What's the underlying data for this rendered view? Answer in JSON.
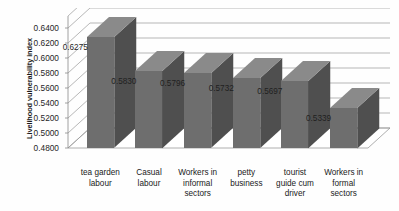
{
  "chart_data": {
    "type": "bar",
    "title": "",
    "xlabel": "",
    "ylabel": "Livelihood vulnerability index",
    "categories": [
      "tea garden labour",
      "Casual labour",
      "Workers in informal sectors",
      "petty business",
      "tourist guide cum driver",
      "Workers in formal sectors"
    ],
    "category_lines": [
      [
        "tea garden",
        "labour"
      ],
      [
        "Casual",
        "labour"
      ],
      [
        "Workers in",
        "informal",
        "sectors"
      ],
      [
        "petty",
        "business"
      ],
      [
        "tourist",
        "guide cum",
        "driver"
      ],
      [
        "Workers in",
        "formal",
        "sectors"
      ]
    ],
    "values": [
      0.6275,
      0.583,
      0.5796,
      0.5732,
      0.5697,
      0.5339
    ],
    "value_labels": [
      "0.6275",
      "0.5830",
      "0.5796",
      "0.5732",
      "0.5697",
      "0.5339"
    ],
    "ylim": [
      0.48,
      0.64
    ],
    "ytick_values": [
      0.64,
      0.62,
      0.6,
      0.58,
      0.56,
      0.54,
      0.52,
      0.5,
      0.48
    ],
    "ytick_labels": [
      "0.6400",
      "0.6200",
      "0.6000",
      "0.5800",
      "0.5600",
      "0.5400",
      "0.5200",
      "0.5000",
      "0.4800"
    ],
    "grid": true,
    "legend": "none",
    "style": "3d-column",
    "colors": {
      "bar_front": "#6e6e6e",
      "bar_top": "#8a8a8a",
      "bar_side": "#4f4f4f",
      "gridline": "#9a9a9a",
      "axis": "#8c8c8c",
      "text": "#1a1a1a",
      "background": "#fefefe"
    }
  }
}
